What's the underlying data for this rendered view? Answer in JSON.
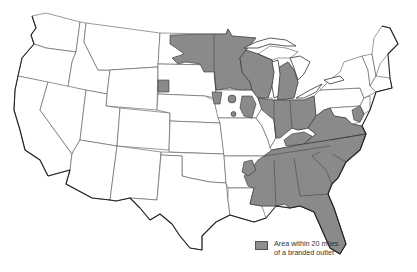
{
  "map": {
    "title": "",
    "region": "Contiguous United States",
    "shade_color": "#8a8a8a",
    "outline_color": "#333333",
    "shaded_regions": [
      "Minnesota (most)",
      "Wisconsin",
      "Michigan (Lower Peninsula)",
      "Iowa (eastern patches)",
      "Illinois (northern)",
      "Indiana",
      "Ohio",
      "West Virginia",
      "Virginia",
      "North Carolina",
      "South Carolina",
      "Georgia",
      "Florida",
      "Alabama",
      "Mississippi",
      "Tennessee",
      "Kentucky (parts)",
      "Arkansas (eastern edge)",
      "Louisiana (eastern)",
      "Maryland",
      "Delaware",
      "North Dakota (eastern)",
      "South Dakota (small area near Black Hills)"
    ]
  },
  "legend": {
    "swatch_label_line1": "Area within 20 miles",
    "swatch_label_line2": "of a branded outlet"
  }
}
